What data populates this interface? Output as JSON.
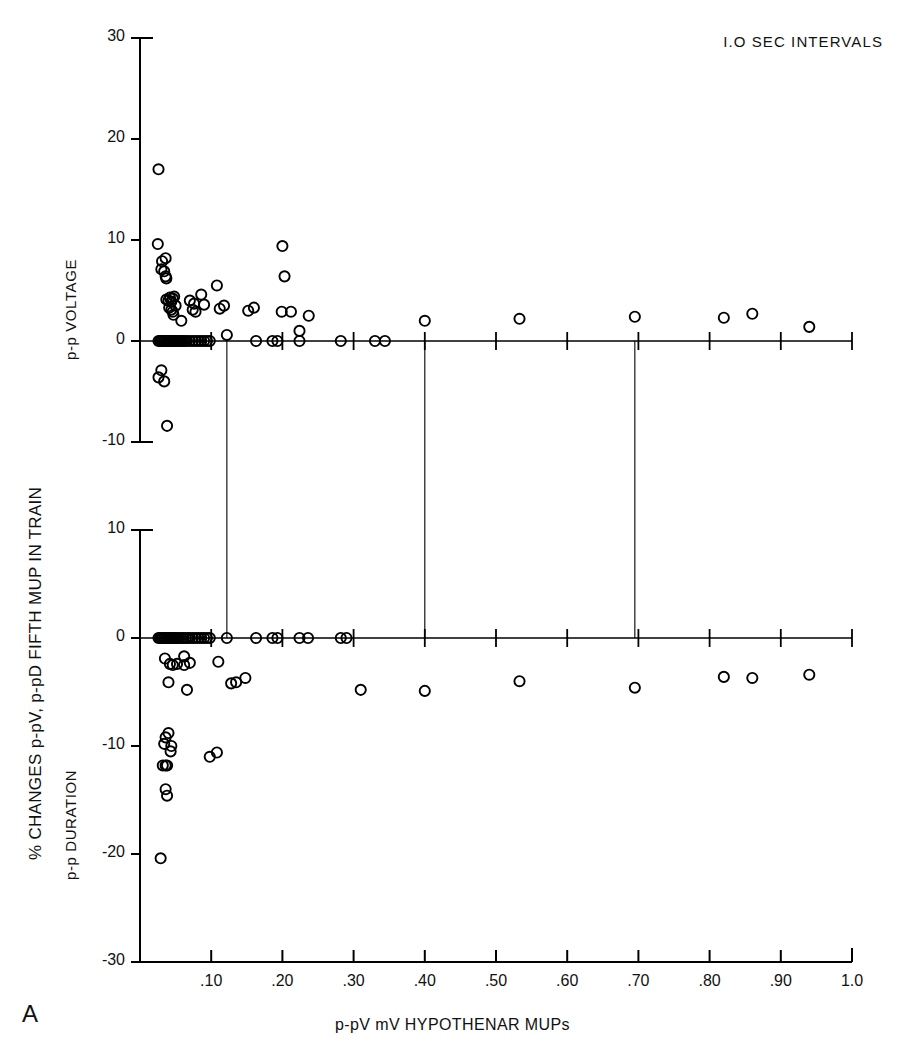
{
  "figure": {
    "panel_letter": "A",
    "annotation": "I.O SEC INTERVALS",
    "x_axis_title": "p-pV mV HYPOTHENAR MUPs",
    "y_axis_title": "% CHANGES p-pV, p-pD FIFTH MUP IN TRAIN",
    "top_panel_title": "p-p VOLTAGE",
    "bottom_panel_title": "p-p DURATION",
    "marker_style": "open-circle",
    "marker_color": "#000000",
    "axis_color": "#000000",
    "background": "#ffffff"
  },
  "chart_data": [
    {
      "type": "scatter",
      "title": "p-p VOLTAGE",
      "xlabel": "p-pV mV HYPOTHENAR MUPs",
      "ylabel": "% CHANGES p-pV FIFTH MUP IN TRAIN",
      "xlim": [
        0.0,
        1.0
      ],
      "ylim": [
        -10,
        30
      ],
      "xticks": [
        0.1,
        0.2,
        0.3,
        0.4,
        0.5,
        0.6,
        0.7,
        0.8,
        0.9,
        1.0
      ],
      "xtick_labels": [
        ".10",
        ".20",
        ".30",
        ".40",
        ".50",
        ".60",
        ".70",
        ".80",
        ".90",
        "1.0"
      ],
      "yticks": [
        -10,
        0,
        10,
        20,
        30
      ],
      "ytick_labels": [
        "-10",
        "0",
        "10",
        "20",
        "30"
      ],
      "grid": false,
      "legend": "none",
      "points": [
        [
          0.026,
          17.0
        ],
        [
          0.025,
          9.6
        ],
        [
          0.031,
          7.9
        ],
        [
          0.036,
          8.2
        ],
        [
          0.03,
          7.1
        ],
        [
          0.034,
          6.9
        ],
        [
          0.036,
          6.4
        ],
        [
          0.037,
          6.2
        ],
        [
          0.037,
          4.1
        ],
        [
          0.04,
          4.0
        ],
        [
          0.042,
          4.3
        ],
        [
          0.046,
          4.2
        ],
        [
          0.044,
          3.9
        ],
        [
          0.048,
          4.4
        ],
        [
          0.041,
          3.3
        ],
        [
          0.044,
          3.1
        ],
        [
          0.046,
          2.9
        ],
        [
          0.05,
          3.5
        ],
        [
          0.047,
          2.6
        ],
        [
          0.058,
          2.0
        ],
        [
          0.07,
          4.0
        ],
        [
          0.076,
          3.7
        ],
        [
          0.074,
          3.1
        ],
        [
          0.078,
          2.9
        ],
        [
          0.086,
          4.6
        ],
        [
          0.09,
          3.6
        ],
        [
          0.108,
          5.5
        ],
        [
          0.112,
          3.2
        ],
        [
          0.118,
          3.5
        ],
        [
          0.122,
          0.6
        ],
        [
          0.2,
          9.4
        ],
        [
          0.203,
          6.4
        ],
        [
          0.152,
          3.0
        ],
        [
          0.16,
          3.3
        ],
        [
          0.199,
          2.9
        ],
        [
          0.212,
          2.9
        ],
        [
          0.237,
          2.5
        ],
        [
          0.224,
          1.0
        ],
        [
          0.026,
          0.0
        ],
        [
          0.028,
          0.0
        ],
        [
          0.03,
          0.0
        ],
        [
          0.032,
          0.0
        ],
        [
          0.034,
          0.0
        ],
        [
          0.036,
          0.0
        ],
        [
          0.038,
          0.0
        ],
        [
          0.04,
          0.0
        ],
        [
          0.042,
          0.0
        ],
        [
          0.044,
          0.0
        ],
        [
          0.046,
          0.0
        ],
        [
          0.048,
          0.0
        ],
        [
          0.05,
          0.0
        ],
        [
          0.052,
          0.0
        ],
        [
          0.054,
          0.0
        ],
        [
          0.056,
          0.0
        ],
        [
          0.058,
          0.0
        ],
        [
          0.06,
          0.0
        ],
        [
          0.063,
          0.0
        ],
        [
          0.066,
          0.0
        ],
        [
          0.07,
          0.0
        ],
        [
          0.074,
          0.0
        ],
        [
          0.078,
          0.0
        ],
        [
          0.082,
          0.0
        ],
        [
          0.086,
          0.0
        ],
        [
          0.09,
          0.0
        ],
        [
          0.094,
          0.0
        ],
        [
          0.098,
          0.0
        ],
        [
          0.163,
          0.0
        ],
        [
          0.186,
          0.0
        ],
        [
          0.193,
          0.0
        ],
        [
          0.224,
          0.0
        ],
        [
          0.282,
          0.0
        ],
        [
          0.33,
          0.0
        ],
        [
          0.344,
          0.0
        ],
        [
          0.4,
          2.0
        ],
        [
          0.533,
          2.2
        ],
        [
          0.695,
          2.4
        ],
        [
          0.82,
          2.3
        ],
        [
          0.86,
          2.7
        ],
        [
          0.94,
          1.4
        ],
        [
          0.03,
          -2.9
        ],
        [
          0.026,
          -3.6
        ],
        [
          0.034,
          -4.0
        ],
        [
          0.038,
          -8.4
        ]
      ],
      "drop_lines_x": [
        0.122,
        0.4,
        0.695
      ]
    },
    {
      "type": "scatter",
      "title": "p-p DURATION",
      "xlabel": "p-pV mV HYPOTHENAR MUPs",
      "ylabel": "% CHANGES p-pD FIFTH MUP IN TRAIN",
      "xlim": [
        0.0,
        1.0
      ],
      "ylim": [
        -30,
        10
      ],
      "xticks": [
        0.1,
        0.2,
        0.3,
        0.4,
        0.5,
        0.6,
        0.7,
        0.8,
        0.9,
        1.0
      ],
      "xtick_labels": [
        ".10",
        ".20",
        ".30",
        ".40",
        ".50",
        ".60",
        ".70",
        ".80",
        ".90",
        "1.0"
      ],
      "yticks": [
        -30,
        -20,
        -10,
        0,
        10
      ],
      "ytick_labels": [
        "-30",
        "-20",
        "-10",
        "0",
        "10"
      ],
      "grid": false,
      "legend": "none",
      "points": [
        [
          0.026,
          0.0
        ],
        [
          0.028,
          0.0
        ],
        [
          0.03,
          0.0
        ],
        [
          0.032,
          0.0
        ],
        [
          0.034,
          0.0
        ],
        [
          0.036,
          0.0
        ],
        [
          0.038,
          0.0
        ],
        [
          0.04,
          0.0
        ],
        [
          0.042,
          0.0
        ],
        [
          0.044,
          0.0
        ],
        [
          0.046,
          0.0
        ],
        [
          0.048,
          0.0
        ],
        [
          0.05,
          0.0
        ],
        [
          0.052,
          0.0
        ],
        [
          0.055,
          0.0
        ],
        [
          0.058,
          0.0
        ],
        [
          0.061,
          0.0
        ],
        [
          0.064,
          0.0
        ],
        [
          0.067,
          0.0
        ],
        [
          0.07,
          0.0
        ],
        [
          0.074,
          0.0
        ],
        [
          0.078,
          0.0
        ],
        [
          0.082,
          0.0
        ],
        [
          0.086,
          0.0
        ],
        [
          0.09,
          0.0
        ],
        [
          0.094,
          0.0
        ],
        [
          0.098,
          0.0
        ],
        [
          0.122,
          0.0
        ],
        [
          0.163,
          0.0
        ],
        [
          0.186,
          0.0
        ],
        [
          0.193,
          0.0
        ],
        [
          0.224,
          0.0
        ],
        [
          0.236,
          0.0
        ],
        [
          0.282,
          0.0
        ],
        [
          0.29,
          0.0
        ],
        [
          0.035,
          -1.9
        ],
        [
          0.042,
          -2.4
        ],
        [
          0.046,
          -2.5
        ],
        [
          0.052,
          -2.4
        ],
        [
          0.062,
          -1.7
        ],
        [
          0.062,
          -2.5
        ],
        [
          0.07,
          -2.3
        ],
        [
          0.04,
          -4.1
        ],
        [
          0.066,
          -4.8
        ],
        [
          0.11,
          -2.2
        ],
        [
          0.128,
          -4.2
        ],
        [
          0.135,
          -4.1
        ],
        [
          0.148,
          -3.7
        ],
        [
          0.31,
          -4.8
        ],
        [
          0.4,
          -4.9
        ],
        [
          0.533,
          -4.0
        ],
        [
          0.695,
          -4.6
        ],
        [
          0.82,
          -3.6
        ],
        [
          0.86,
          -3.7
        ],
        [
          0.94,
          -3.4
        ],
        [
          0.036,
          -9.2
        ],
        [
          0.04,
          -8.8
        ],
        [
          0.034,
          -9.8
        ],
        [
          0.044,
          -10.0
        ],
        [
          0.043,
          -10.5
        ],
        [
          0.032,
          -11.8
        ],
        [
          0.036,
          -11.8
        ],
        [
          0.038,
          -11.8
        ],
        [
          0.036,
          -14.0
        ],
        [
          0.038,
          -14.6
        ],
        [
          0.098,
          -11.0
        ],
        [
          0.108,
          -10.6
        ],
        [
          0.029,
          -20.4
        ]
      ],
      "drop_lines_x": [
        0.122,
        0.4,
        0.695
      ]
    }
  ]
}
